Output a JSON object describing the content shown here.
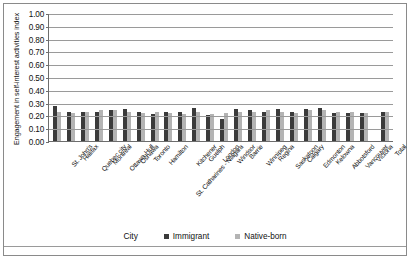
{
  "axes": {
    "ylabel": "Engagement in self-interest activities index",
    "xlabel": "City",
    "yticks": [
      "1.00",
      "0.90",
      "0.80",
      "0.70",
      "0.60",
      "0.50",
      "0.40",
      "0.30",
      "0.20",
      "0.10",
      "0.00"
    ]
  },
  "legend": {
    "immigrant": "Immigrant",
    "native_born": "Native-born",
    "immigrant_color": "#3b3b3b",
    "native_color": "#b4b4b4"
  },
  "chart_data": {
    "type": "bar",
    "title": "",
    "xlabel": "City",
    "ylabel": "Engagement in self-interest activities index",
    "ylim": [
      0,
      1.0
    ],
    "ytick_step": 0.1,
    "grid": true,
    "legend_position": "bottom",
    "categories": [
      "St. John's",
      "Halifax",
      "Quebec city",
      "Montreal",
      "Ottawa-Hull",
      "Oshawa",
      "Toronto",
      "Hamilton",
      "St. Catharines - Niagara",
      "Kitchener",
      "Guelph",
      "London",
      "Windsor",
      "Barrie",
      "Winnipeg",
      "Regina",
      "Saskatoon",
      "Calgary",
      "Edmonton",
      "Kelowna",
      "Abbotsford",
      "Vancouver",
      "Victoria",
      "Total"
    ],
    "series": [
      {
        "name": "Immigrant",
        "color": "#3b3b3b",
        "values": [
          0.27,
          0.23,
          0.23,
          0.23,
          0.24,
          0.25,
          0.23,
          0.21,
          0.23,
          0.23,
          0.26,
          0.2,
          0.17,
          0.25,
          0.24,
          0.23,
          0.25,
          0.23,
          0.25,
          0.26,
          0.22,
          0.22,
          0.22,
          0.23
        ]
      },
      {
        "name": "Native-born",
        "color": "#b4b4b4",
        "values": [
          0.23,
          0.22,
          0.23,
          0.24,
          0.24,
          0.23,
          0.22,
          0.23,
          0.22,
          0.21,
          0.23,
          0.21,
          0.22,
          0.23,
          0.23,
          0.24,
          0.23,
          0.22,
          0.24,
          0.24,
          0.23,
          0.23,
          0.22,
          0.23
        ]
      }
    ]
  }
}
